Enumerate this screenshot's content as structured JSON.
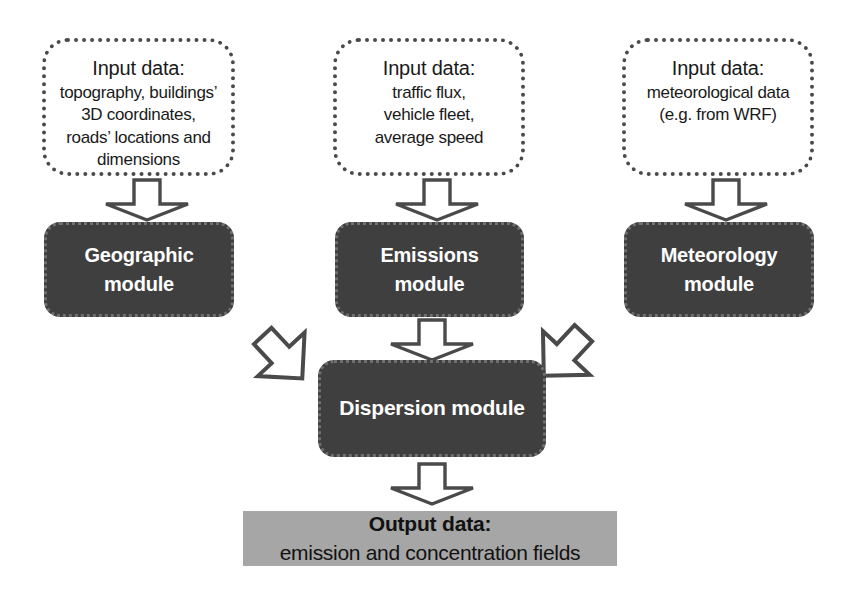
{
  "diagram": {
    "colors": {
      "module_fill": "#3f3f3f",
      "module_text": "#ffffff",
      "output_fill": "#a6a6a6",
      "output_text": "#111111",
      "box_border": "#4a4a4a",
      "arrow_stroke": "#4a4a4a",
      "background": "#ffffff"
    },
    "inputs": [
      {
        "id": "geographic-input",
        "title": "Input data:",
        "lines": [
          "topography, buildings’",
          "3D coordinates,",
          "roads’ locations and",
          "dimensions"
        ]
      },
      {
        "id": "emissions-input",
        "title": "Input data:",
        "lines": [
          "traffic flux,",
          "vehicle fleet,",
          "average speed"
        ]
      },
      {
        "id": "meteorology-input",
        "title": "Input data:",
        "lines": [
          "meteorological data",
          "(e.g. from WRF)"
        ]
      }
    ],
    "modules": [
      {
        "id": "geographic-module",
        "lines": [
          "Geographic",
          "module"
        ]
      },
      {
        "id": "emissions-module",
        "lines": [
          "Emissions",
          "module"
        ]
      },
      {
        "id": "meteorology-module",
        "lines": [
          "Meteorology",
          "module"
        ]
      }
    ],
    "dispersion": {
      "id": "dispersion-module",
      "lines": [
        "Dispersion module"
      ]
    },
    "output": {
      "id": "output-data",
      "title": "Output data:",
      "subtitle": "emission and concentration fields"
    },
    "arrows": [
      {
        "id": "arrow-geographic-input-to-module",
        "direction": "down"
      },
      {
        "id": "arrow-emissions-input-to-module",
        "direction": "down"
      },
      {
        "id": "arrow-meteorology-input-to-module",
        "direction": "down"
      },
      {
        "id": "arrow-geographic-to-dispersion",
        "direction": "down-right"
      },
      {
        "id": "arrow-emissions-to-dispersion",
        "direction": "down"
      },
      {
        "id": "arrow-meteorology-to-dispersion",
        "direction": "down-left"
      },
      {
        "id": "arrow-dispersion-to-output",
        "direction": "down"
      }
    ]
  }
}
